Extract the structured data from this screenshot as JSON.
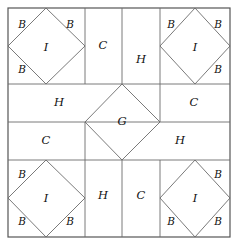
{
  "figure": {
    "background_color": "#ffffff",
    "line_color": "#6b6b6b",
    "frame_color": "#555555",
    "label_color": "#111111",
    "width": 238,
    "height": 244
  },
  "labels": {
    "corner_top_left": {
      "piece_I": "I",
      "piece_B_1": "B",
      "piece_B_2": "B",
      "piece_B_3": "B"
    },
    "corner_top_right": {
      "piece_I": "I",
      "piece_B_1": "B",
      "piece_B_2": "B",
      "piece_B_3": "B"
    },
    "corner_bottom_left": {
      "piece_I": "I",
      "piece_B_1": "B",
      "piece_B_2": "B",
      "piece_B_3": "B"
    },
    "corner_bottom_right": {
      "piece_I": "I",
      "piece_B_1": "B",
      "piece_B_2": "B",
      "piece_B_3": "B"
    },
    "edge_top_C": "C",
    "edge_top_H": "H",
    "edge_right_C": "C",
    "edge_right_H": "H",
    "edge_left_H": "H",
    "edge_left_C": "C",
    "edge_bottom_H": "H",
    "edge_bottom_C": "C",
    "center_G": "G"
  },
  "geometry": {
    "frame": {
      "x": 8,
      "y": 8,
      "width": 222,
      "height": 229
    },
    "grid_x": [
      8,
      85,
      122,
      160,
      230
    ],
    "grid_y": [
      8,
      84,
      122,
      160,
      237
    ],
    "center_diamond": {
      "top": [
        122,
        84
      ],
      "right": [
        160,
        122
      ],
      "bottom": [
        122,
        160
      ],
      "left": [
        85,
        122
      ]
    }
  }
}
